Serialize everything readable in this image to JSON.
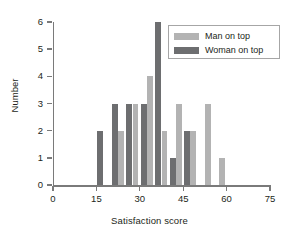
{
  "chart_data": {
    "type": "bar",
    "title": "",
    "xlabel": "Satisfaction score",
    "ylabel": "Number",
    "xlim": [
      0,
      75
    ],
    "ylim": [
      0,
      6
    ],
    "xticks": [
      0,
      15,
      30,
      45,
      60,
      75
    ],
    "yticks": [
      0,
      1,
      2,
      3,
      4,
      5,
      6
    ],
    "grid": false,
    "legend_position": "top-right",
    "bin_width": 5,
    "series": [
      {
        "name": "Man on top",
        "color": "#b3b3b3",
        "bins": [
          {
            "x": 20,
            "value": 2
          },
          {
            "x": 25,
            "value": 3
          },
          {
            "x": 30,
            "value": 4
          },
          {
            "x": 35,
            "value": 2
          },
          {
            "x": 40,
            "value": 3
          },
          {
            "x": 45,
            "value": 2
          },
          {
            "x": 50,
            "value": 3
          },
          {
            "x": 55,
            "value": 1
          }
        ]
      },
      {
        "name": "Woman on top",
        "color": "#6d6e70",
        "bins": [
          {
            "x": 15,
            "value": 2
          },
          {
            "x": 20,
            "value": 3
          },
          {
            "x": 25,
            "value": 3
          },
          {
            "x": 30,
            "value": 3
          },
          {
            "x": 35,
            "value": 6
          },
          {
            "x": 40,
            "value": 1
          },
          {
            "x": 45,
            "value": 2
          }
        ]
      }
    ]
  },
  "legend": {
    "items": [
      {
        "label": "Man on top",
        "color": "#b3b3b3"
      },
      {
        "label": "Woman on top",
        "color": "#6d6e70"
      }
    ]
  },
  "axes": {
    "x": {
      "label": "Satisfaction score",
      "ticklabels": [
        "0",
        "15",
        "30",
        "45",
        "60",
        "75"
      ]
    },
    "y": {
      "label": "Number",
      "ticklabels": [
        "0",
        "1",
        "2",
        "3",
        "4",
        "5",
        "6"
      ]
    }
  },
  "colors": {
    "man": "#b3b3b3",
    "woman": "#6d6e70",
    "axis": "#7a7a7a",
    "text": "#231f20",
    "background": "#ffffff"
  }
}
